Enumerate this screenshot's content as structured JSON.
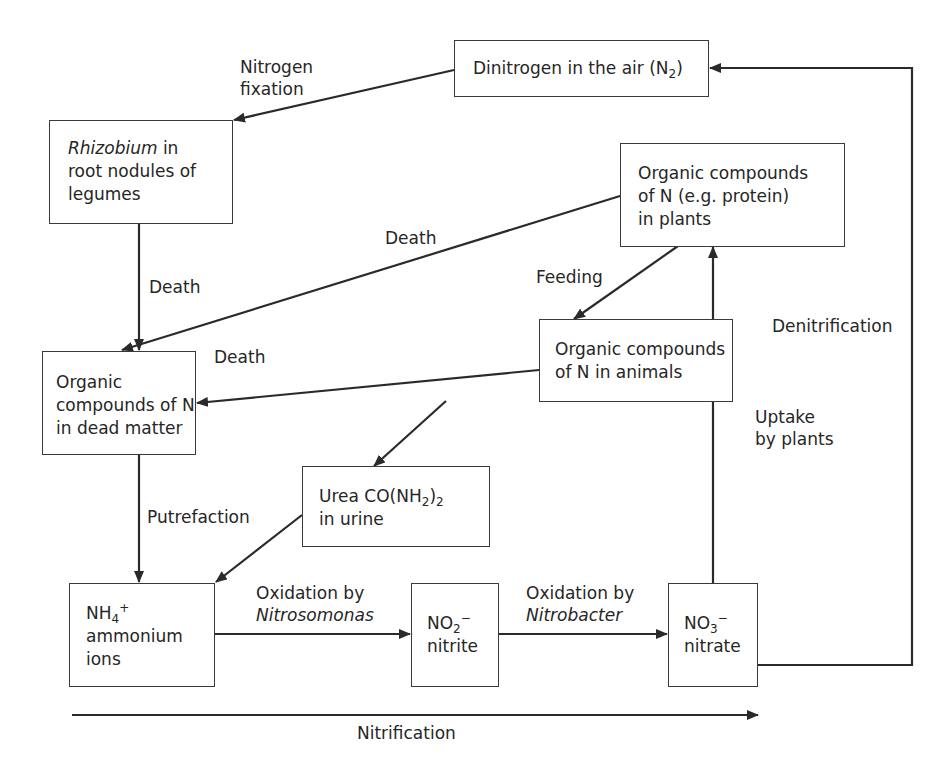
{
  "nodes": {
    "dinitrogen": {
      "text": "Dinitrogen in the air (N",
      "sub": "2",
      "close": ")"
    },
    "rhizobium": {
      "italic": "Rhizobium",
      "line1_rest": " in",
      "line2": "root nodules of",
      "line3": "legumes"
    },
    "plants": {
      "line1": "Organic compounds",
      "line2": "of N (e.g. protein)",
      "line3": "in plants"
    },
    "animals": {
      "line1": "Organic compounds",
      "line2": "of N in animals"
    },
    "dead_matter": {
      "line1": "Organic",
      "line2": "compounds of N",
      "line3": "in dead matter"
    },
    "urea": {
      "prefix": "Urea CO(NH",
      "sub1": "2",
      "mid": ")",
      "sub2": "2",
      "line2": "in urine"
    },
    "ammonium": {
      "formula": "NH",
      "sub": "4",
      "sup": "+",
      "line2": "ammonium",
      "line3": "ions"
    },
    "nitrite": {
      "formula": "NO",
      "sub": "2",
      "sup": "−",
      "line2": "nitrite"
    },
    "nitrate": {
      "formula": "NO",
      "sub": "3",
      "sup": "−",
      "line2": "nitrate"
    }
  },
  "edges": {
    "nitrogen_fixation": {
      "line1": "Nitrogen",
      "line2": "fixation"
    },
    "death_rhizobium": "Death",
    "death_plants": "Death",
    "feeding": "Feeding",
    "death_animals": "Death",
    "putrefaction": "Putrefaction",
    "oxidation_nitrosomonas": {
      "line1": "Oxidation by",
      "line2": "Nitrosomonas"
    },
    "oxidation_nitrobacter": {
      "line1": "Oxidation by",
      "line2": "Nitrobacter"
    },
    "uptake": {
      "line1": "Uptake",
      "line2": "by plants"
    },
    "denitrification": "Denitrification",
    "nitrification": "Nitrification"
  },
  "colors": {
    "line": "#2a2a2a",
    "text": "#262626",
    "background": "#ffffff"
  }
}
